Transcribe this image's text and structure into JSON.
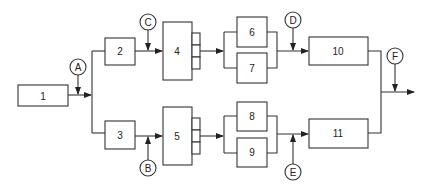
{
  "diagram": {
    "type": "process block diagram",
    "blocks": [
      {
        "id": "1",
        "label": "1"
      },
      {
        "id": "2",
        "label": "2"
      },
      {
        "id": "3",
        "label": "3"
      },
      {
        "id": "4",
        "label": "4"
      },
      {
        "id": "5",
        "label": "5"
      },
      {
        "id": "6",
        "label": "6"
      },
      {
        "id": "7",
        "label": "7"
      },
      {
        "id": "8",
        "label": "8"
      },
      {
        "id": "9",
        "label": "9"
      },
      {
        "id": "10",
        "label": "10"
      },
      {
        "id": "11",
        "label": "11"
      }
    ],
    "injection_points": [
      {
        "id": "A",
        "label": "A",
        "position": "between 1 and split"
      },
      {
        "id": "B",
        "label": "B",
        "position": "between 3 and 5"
      },
      {
        "id": "C",
        "label": "C",
        "position": "between 2 and 4"
      },
      {
        "id": "D",
        "label": "D",
        "position": "between 6/7 and 10"
      },
      {
        "id": "E",
        "label": "E",
        "position": "between 8/9 and 11"
      },
      {
        "id": "F",
        "label": "F",
        "position": "after merge of 10 and 11"
      }
    ],
    "connections": [
      [
        "1",
        "split"
      ],
      [
        "split",
        "2"
      ],
      [
        "split",
        "3"
      ],
      [
        "2",
        "4"
      ],
      [
        "3",
        "5"
      ],
      [
        "4",
        "6"
      ],
      [
        "4",
        "7"
      ],
      [
        "5",
        "8"
      ],
      [
        "5",
        "9"
      ],
      [
        "6",
        "10"
      ],
      [
        "7",
        "10"
      ],
      [
        "8",
        "11"
      ],
      [
        "9",
        "11"
      ],
      [
        "10",
        "output"
      ],
      [
        "11",
        "output"
      ]
    ],
    "stroke_color": "#333333",
    "background_color": "#ffffff"
  }
}
